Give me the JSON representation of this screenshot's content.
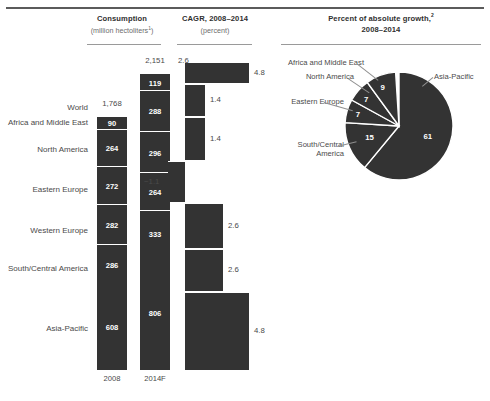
{
  "headers": {
    "consumption": {
      "title": "Consumption",
      "sub": "(million hectoliters",
      "sub_sup": "1",
      "sub_close": ")"
    },
    "cagr": {
      "title": "CAGR, 2008–2014",
      "sub": "(percent)"
    },
    "pie": {
      "title": "Percent of absolute growth,",
      "title_sup": "2",
      "subtitle": "2008–2014"
    }
  },
  "rows": [
    {
      "label": "World"
    },
    {
      "label": "Africa and Middle East"
    },
    {
      "label": "North America"
    },
    {
      "label": "Eastern Europe"
    },
    {
      "label": "Western Europe"
    },
    {
      "label": "South/Central America"
    },
    {
      "label": "Asia-Pacific"
    }
  ],
  "axis": {
    "left_footer": "2008",
    "right_footer": "2014F"
  },
  "chart_data": [
    {
      "type": "bar",
      "title": "Consumption (million hectoliters)",
      "stacked": true,
      "categories": [
        "Africa and Middle East",
        "North America",
        "Eastern Europe",
        "Western Europe",
        "South/Central America",
        "Asia-Pacific"
      ],
      "series": [
        {
          "name": "2008",
          "total": 1768,
          "total_label": "1,768",
          "values": [
            90,
            264,
            272,
            282,
            286,
            608
          ]
        },
        {
          "name": "2014F",
          "total": 2151,
          "total_label": "2,151",
          "values": [
            119,
            288,
            296,
            264,
            333,
            806
          ]
        }
      ],
      "xlabel": "",
      "ylabel": "million hectoliters",
      "grid": false,
      "legend": "none"
    },
    {
      "type": "bar",
      "title": "CAGR, 2008–2014 (percent)",
      "orientation": "horizontal",
      "categories": [
        "World",
        "Africa and Middle East",
        "North America",
        "Eastern Europe",
        "Western Europe",
        "South/Central America",
        "Asia-Pacific"
      ],
      "values": [
        2.6,
        4.8,
        1.4,
        1.4,
        -1.1,
        2.6,
        4.8
      ],
      "value_labels": [
        "2.6",
        "4.8",
        "1.4",
        "1.4",
        "−1.1",
        "2.6",
        "4.8"
      ],
      "world_label": "2.6",
      "xlabel": "percent",
      "ylabel": "",
      "grid": false,
      "legend": "none"
    },
    {
      "type": "pie",
      "title": "Percent of absolute growth, 2008–2014",
      "labels": [
        "Asia-Pacific",
        "South/Central America",
        "Eastern Europe",
        "North America",
        "Africa and Middle East"
      ],
      "values": [
        61,
        15,
        7,
        7,
        9
      ],
      "value_labels": [
        "61",
        "15",
        "7",
        "7",
        "9"
      ],
      "legend": "callout"
    }
  ]
}
